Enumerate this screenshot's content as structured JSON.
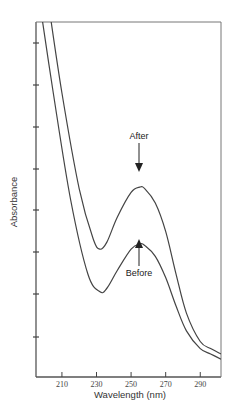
{
  "chart_data": {
    "type": "line",
    "title": "",
    "xlabel": "Wavelength (nm)",
    "ylabel": "Absorbance",
    "xlim": [
      195,
      302
    ],
    "x_ticks": [
      210,
      230,
      250,
      270,
      290
    ],
    "x_tick_labels": [
      "210",
      "230",
      "250",
      "270",
      "290"
    ],
    "y_ticks_count": 8,
    "y_tick_labels": [],
    "grid": false,
    "legend": null,
    "series": [
      {
        "name": "After",
        "x": [
          202,
          210,
          220,
          228,
          232,
          236,
          242,
          250,
          255,
          258,
          264,
          270,
          276,
          282,
          290,
          296,
          302
        ],
        "y_rel": [
          1.06,
          0.8,
          0.53,
          0.39,
          0.36,
          0.38,
          0.45,
          0.52,
          0.535,
          0.53,
          0.49,
          0.41,
          0.29,
          0.18,
          0.1,
          0.08,
          0.065
        ]
      },
      {
        "name": "Before",
        "x": [
          197,
          205,
          215,
          225,
          232,
          236,
          242,
          250,
          255,
          258,
          264,
          270,
          276,
          282,
          290,
          296,
          302
        ],
        "y_rel": [
          1.06,
          0.8,
          0.5,
          0.29,
          0.24,
          0.25,
          0.3,
          0.36,
          0.375,
          0.37,
          0.34,
          0.28,
          0.2,
          0.13,
          0.08,
          0.065,
          0.05
        ]
      }
    ],
    "annotations": [
      {
        "text": "After",
        "x": 256,
        "arrow": "down",
        "target_series": "After"
      },
      {
        "text": "Before",
        "x": 256,
        "arrow": "up",
        "target_series": "Before"
      }
    ]
  }
}
